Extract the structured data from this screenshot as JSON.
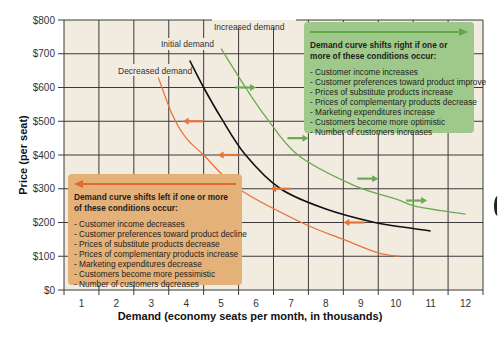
{
  "chart_data": {
    "type": "line",
    "title": "",
    "xlabel": "Demand (economy seats per month, in thousands)",
    "ylabel": "Price (per seat)",
    "x_ticks": [
      "1",
      "2",
      "3",
      "4",
      "5",
      "6",
      "7",
      "8",
      "9",
      "10",
      "11",
      "12"
    ],
    "y_ticks": [
      "$0",
      "$100",
      "$200",
      "$300",
      "$400",
      "$500",
      "$600",
      "$700",
      "$800"
    ],
    "xlim": [
      0.5,
      12.5
    ],
    "ylim": [
      0,
      800
    ],
    "grid": true,
    "background_color": "#f1ebe0",
    "series": [
      {
        "name": "Initial demand",
        "color": "#111111",
        "points": [
          [
            4.1,
            680
          ],
          [
            4.5,
            600
          ],
          [
            5.0,
            510
          ],
          [
            5.7,
            400
          ],
          [
            6.7,
            300
          ],
          [
            8.0,
            240
          ],
          [
            9.4,
            200
          ],
          [
            10.3,
            185
          ],
          [
            11.0,
            175
          ]
        ]
      },
      {
        "name": "Increased demand",
        "color": "#6aab4f",
        "points": [
          [
            5.0,
            715
          ],
          [
            5.7,
            600
          ],
          [
            6.3,
            510
          ],
          [
            7.2,
            400
          ],
          [
            8.8,
            310
          ],
          [
            10.0,
            270
          ],
          [
            10.5,
            250
          ],
          [
            11.3,
            235
          ],
          [
            12.0,
            225
          ]
        ]
      },
      {
        "name": "Decreased demand",
        "color": "#e8743b",
        "points": [
          [
            3.2,
            630
          ],
          [
            3.6,
            520
          ],
          [
            4.0,
            450
          ],
          [
            4.5,
            400
          ],
          [
            5.5,
            300
          ],
          [
            7.3,
            200
          ],
          [
            8.5,
            150
          ],
          [
            9.5,
            110
          ],
          [
            10.1,
            100
          ]
        ]
      }
    ],
    "shift_arrows": [
      {
        "direction": "right",
        "color": "#6aab4f",
        "x_from": 5.4,
        "x_to": 6.0,
        "price": 600
      },
      {
        "direction": "right",
        "color": "#6aab4f",
        "x_from": 6.9,
        "x_to": 7.5,
        "price": 450
      },
      {
        "direction": "right",
        "color": "#6aab4f",
        "x_from": 8.9,
        "x_to": 9.5,
        "price": 330
      },
      {
        "direction": "right",
        "color": "#6aab4f",
        "x_from": 10.3,
        "x_to": 10.9,
        "price": 265
      },
      {
        "direction": "left",
        "color": "#e8743b",
        "x_from": 4.5,
        "x_to": 3.9,
        "price": 500
      },
      {
        "direction": "left",
        "color": "#e8743b",
        "x_from": 5.5,
        "x_to": 4.9,
        "price": 400
      },
      {
        "direction": "left",
        "color": "#e8743b",
        "x_from": 7.0,
        "x_to": 6.4,
        "price": 300
      },
      {
        "direction": "left",
        "color": "#e8743b",
        "x_from": 9.1,
        "x_to": 8.5,
        "price": 200
      }
    ],
    "annotations": [
      {
        "id": "right-shift",
        "title": "Demand curve shifts right if one or more of these conditions occur:",
        "color": "#9fc98a",
        "items": [
          "- Customer income increases",
          "- Customer preferences toward product improve",
          "- Prices of substitute products increase",
          "- Prices of complementary products decrease",
          "- Marketing expenditures increase",
          "- Customers become more optimistic",
          "- Number of customers increases"
        ]
      },
      {
        "id": "left-shift",
        "title": "Demand curve shifts left if one or more of these conditions occur:",
        "color": "#e4b179",
        "items": [
          "- Customer income decreases",
          "- Customer preferences toward product decline",
          "- Prices of substitute products decrease",
          "- Prices of complementary products increase",
          "- Marketing expenditures decrease",
          "- Customers become more pessimistic",
          "- Number of customers decreases"
        ]
      }
    ]
  },
  "labels": {
    "initial": "Initial demand",
    "increased": "Increased demand",
    "decreased": "Decreased demand",
    "xlabel": "Demand (economy seats per month, in thousands)",
    "ylabel": "Price (per seat)"
  },
  "green_box": {
    "title": "Demand curve shifts right if one or more of these conditions occur:",
    "items": [
      "- Customer income increases",
      "- Customer preferences toward product improve",
      "- Prices of substitute products increase",
      "- Prices of complementary products decrease",
      "- Marketing expenditures increase",
      "- Customers become more optimistic",
      "- Number of customers increases"
    ]
  },
  "orange_box": {
    "title": "Demand curve shifts left if one or more of these conditions occur:",
    "items": [
      "- Customer income decreases",
      "- Customer preferences toward product decline",
      "- Prices of substitute products decrease",
      "- Prices of complementary products increase",
      "- Marketing expenditures decrease",
      "- Customers become more pessimistic",
      "- Number of customers decreases"
    ]
  }
}
